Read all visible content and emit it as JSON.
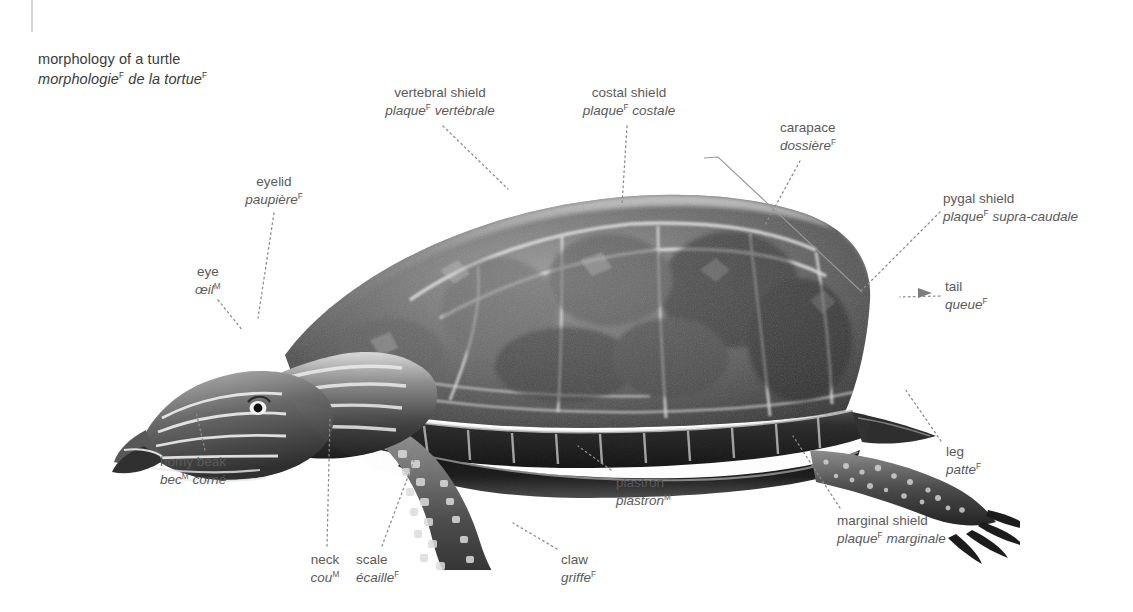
{
  "page": {
    "background": "#ffffff",
    "text_color": "#5a5a5a",
    "title_color": "#3b3b3b",
    "leader_color": "#8c8c8c",
    "width": 1133,
    "height": 612
  },
  "title": {
    "english": "morphology of a turtle",
    "french": "morphologie",
    "french_rest": " de la tortue",
    "french_gender_1": "F",
    "french_gender_2": "F"
  },
  "labels": [
    {
      "key": "vertebral-shield",
      "en": "vertebral shield",
      "fr_main": "plaque",
      "fr_gender": "F",
      "fr_rest": " vertébrale",
      "align": "center",
      "x": 440,
      "y": 84,
      "leader": {
        "type": "dotted",
        "x1": 443,
        "y1": 126,
        "x2": 508,
        "y2": 189
      }
    },
    {
      "key": "costal-shield",
      "en": "costal shield",
      "fr_main": "plaque",
      "fr_gender": "F",
      "fr_rest": " costale",
      "align": "center",
      "x": 630,
      "y": 84,
      "leader": {
        "type": "dotted",
        "x1": 627,
        "y1": 126,
        "x2": 622,
        "y2": 205
      }
    },
    {
      "key": "carapace",
      "en": "carapace",
      "fr_main": "dossière",
      "fr_gender": "F",
      "fr_rest": "",
      "align": "left",
      "x": 780,
      "y": 119,
      "leader": {
        "type": "dotted",
        "x1": 800,
        "y1": 161,
        "x2": 765,
        "y2": 225
      }
    },
    {
      "key": "pygal-shield",
      "en": "pygal shield",
      "fr_main": "plaque",
      "fr_gender": "F",
      "fr_rest": " supra-caudale",
      "align": "left",
      "x": 943,
      "y": 190,
      "leader": {
        "type": "dotted",
        "x1": 940,
        "y1": 212,
        "x2": 862,
        "y2": 290
      }
    },
    {
      "key": "tail",
      "en": "tail",
      "fr_main": "queue",
      "fr_gender": "F",
      "fr_rest": "",
      "align": "left",
      "x": 945,
      "y": 278,
      "leader": {
        "type": "dotted",
        "x1": 940,
        "y1": 296,
        "x2": 900,
        "y2": 297
      }
    },
    {
      "key": "eyelid",
      "en": "eyelid",
      "fr_main": "paupière",
      "fr_gender": "F",
      "fr_rest": "",
      "align": "center",
      "x": 274,
      "y": 173,
      "leader": {
        "type": "dotted",
        "x1": 274,
        "y1": 213,
        "x2": 258,
        "y2": 318
      }
    },
    {
      "key": "eye",
      "en": "eye",
      "fr_main": "œil",
      "fr_gender": "M",
      "fr_rest": "",
      "align": "center",
      "x": 208,
      "y": 263,
      "leader": {
        "type": "dotted",
        "x1": 218,
        "y1": 300,
        "x2": 243,
        "y2": 331
      }
    },
    {
      "key": "horny-beak",
      "en": "homy beak",
      "fr_main": "bec",
      "fr_gender": "M",
      "fr_rest": " corné",
      "align": "left",
      "x": 160,
      "y": 453,
      "leader": {
        "type": "dotted",
        "x1": 205,
        "y1": 450,
        "x2": 196,
        "y2": 412
      }
    },
    {
      "key": "neck",
      "en": "neck",
      "fr_main": "cou",
      "fr_gender": "M",
      "fr_rest": "",
      "align": "center",
      "x": 325,
      "y": 551,
      "leader": {
        "type": "dotted",
        "x1": 327,
        "y1": 546,
        "x2": 330,
        "y2": 418
      }
    },
    {
      "key": "scale",
      "en": "scale",
      "fr_main": "écaille",
      "fr_gender": "F",
      "fr_rest": "",
      "align": "center",
      "x": 386,
      "y": 551,
      "leader": {
        "type": "dotted",
        "x1": 382,
        "y1": 546,
        "x2": 416,
        "y2": 455
      }
    },
    {
      "key": "claw",
      "en": "claw",
      "fr_main": "griffe",
      "fr_gender": "F",
      "fr_rest": "",
      "align": "left",
      "x": 561,
      "y": 551,
      "leader": {
        "type": "dotted",
        "x1": 557,
        "y1": 549,
        "x2": 513,
        "y2": 523
      }
    },
    {
      "key": "plastron",
      "en": "plastron",
      "fr_main": "plastron",
      "fr_gender": "M",
      "fr_rest": "",
      "align": "left",
      "x": 616,
      "y": 474,
      "leader": {
        "type": "dotted",
        "x1": 611,
        "y1": 470,
        "x2": 578,
        "y2": 446
      }
    },
    {
      "key": "marginal-shield",
      "en": "marginal shield",
      "fr_main": "plaque",
      "fr_gender": "F",
      "fr_rest": " marginale",
      "align": "left",
      "x": 837,
      "y": 512,
      "leader": {
        "type": "dotted",
        "x1": 840,
        "y1": 508,
        "x2": 793,
        "y2": 436
      }
    },
    {
      "key": "leg",
      "en": "leg",
      "fr_main": "patte",
      "fr_gender": "F",
      "fr_rest": "",
      "align": "left",
      "x": 946,
      "y": 443,
      "leader": {
        "type": "dotted",
        "x1": 941,
        "y1": 441,
        "x2": 905,
        "y2": 389
      }
    }
  ],
  "carapace_bracket": {
    "description": "solid-line bracket from carapace label to shell rim",
    "points": "704,158 718,157 862,292"
  },
  "illustration": {
    "name": "turtle-photograph",
    "subject": "painted turtle, side view, facing left",
    "palette": {
      "shell_dark": "#3f3f3f",
      "shell_mid": "#777777",
      "shell_light": "#c9c9c9",
      "scute_seam": "#e3e3e3",
      "skin_dark": "#2c2c2c",
      "skin_light": "#d6d6d6"
    }
  }
}
